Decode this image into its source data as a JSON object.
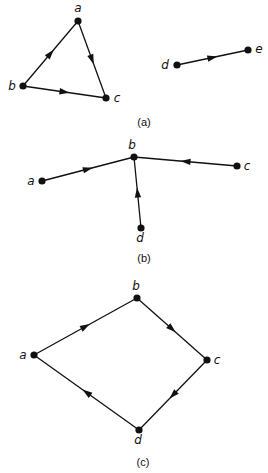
{
  "colors": {
    "ink": "#111111",
    "background": "#ffffff"
  },
  "diagrams": [
    {
      "caption": "(a)",
      "caption_pos": [
        144,
        126
      ],
      "nodes": [
        {
          "id": "a",
          "label": "a",
          "x": 78,
          "y": 21,
          "lx": 78,
          "ly": 12,
          "anchor": "middle"
        },
        {
          "id": "b",
          "label": "b",
          "x": 23,
          "y": 86,
          "lx": 12,
          "ly": 90,
          "anchor": "middle"
        },
        {
          "id": "c",
          "label": "c",
          "x": 106,
          "y": 98,
          "lx": 117,
          "ly": 102,
          "anchor": "middle"
        },
        {
          "id": "d",
          "label": "d",
          "x": 177,
          "y": 65,
          "lx": 165,
          "ly": 69,
          "anchor": "middle"
        },
        {
          "id": "e",
          "label": "e",
          "x": 248,
          "y": 50,
          "lx": 259,
          "ly": 53,
          "anchor": "middle"
        }
      ],
      "edges": [
        {
          "from": "b",
          "to": "a"
        },
        {
          "from": "a",
          "to": "c"
        },
        {
          "from": "b",
          "to": "c"
        },
        {
          "from": "d",
          "to": "e"
        }
      ]
    },
    {
      "caption": "(b)",
      "caption_pos": [
        144,
        262
      ],
      "nodes": [
        {
          "id": "b",
          "label": "b",
          "x": 134,
          "y": 157,
          "lx": 132,
          "ly": 149,
          "anchor": "middle"
        },
        {
          "id": "a",
          "label": "a",
          "x": 42,
          "y": 181,
          "lx": 31,
          "ly": 185,
          "anchor": "middle"
        },
        {
          "id": "c",
          "label": "c",
          "x": 237,
          "y": 166,
          "lx": 247,
          "ly": 170,
          "anchor": "middle"
        },
        {
          "id": "d",
          "label": "d",
          "x": 141,
          "y": 228,
          "lx": 140,
          "ly": 242,
          "anchor": "middle"
        }
      ],
      "edges": [
        {
          "from": "a",
          "to": "b"
        },
        {
          "from": "c",
          "to": "b"
        },
        {
          "from": "d",
          "to": "b"
        }
      ]
    },
    {
      "caption": "(c)",
      "caption_pos": [
        143,
        466
      ],
      "nodes": [
        {
          "id": "b",
          "label": "b",
          "x": 137,
          "y": 298,
          "lx": 136,
          "ly": 290,
          "anchor": "middle"
        },
        {
          "id": "a",
          "label": "a",
          "x": 34,
          "y": 355,
          "lx": 23,
          "ly": 359,
          "anchor": "middle"
        },
        {
          "id": "c",
          "label": "c",
          "x": 207,
          "y": 360,
          "lx": 217,
          "ly": 364,
          "anchor": "middle"
        },
        {
          "id": "d",
          "label": "d",
          "x": 139,
          "y": 430,
          "lx": 138,
          "ly": 444,
          "anchor": "middle"
        }
      ],
      "edges": [
        {
          "from": "a",
          "to": "b"
        },
        {
          "from": "b",
          "to": "c"
        },
        {
          "from": "c",
          "to": "d"
        },
        {
          "from": "d",
          "to": "a"
        }
      ]
    }
  ]
}
